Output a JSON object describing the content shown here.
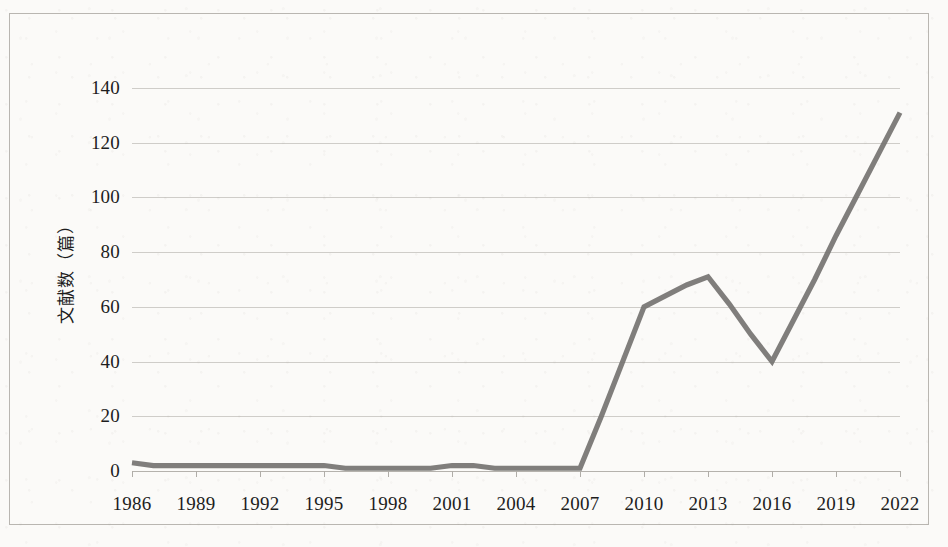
{
  "chart_data": {
    "type": "line",
    "title": "",
    "xlabel": "",
    "ylabel": "文献数（篇）",
    "ylim": [
      0,
      140
    ],
    "yticks": [
      0,
      20,
      40,
      60,
      80,
      100,
      120,
      140
    ],
    "xticklabels": [
      "1986",
      "1989",
      "1992",
      "1995",
      "1998",
      "2001",
      "2004",
      "2007",
      "2010",
      "2013",
      "2016",
      "2019",
      "2022"
    ],
    "xlim": [
      1986,
      2022
    ],
    "grid": true,
    "legend": false,
    "legend_position": "none",
    "line_color": "#767472",
    "x": [
      1986,
      1987,
      1988,
      1989,
      1990,
      1991,
      1992,
      1993,
      1994,
      1995,
      1996,
      1997,
      1998,
      1999,
      2000,
      2001,
      2002,
      2003,
      2004,
      2005,
      2006,
      2007,
      2008,
      2009,
      2010,
      2011,
      2012,
      2013,
      2014,
      2015,
      2016,
      2017,
      2018,
      2019,
      2020,
      2021,
      2022
    ],
    "values": [
      3,
      2,
      2,
      2,
      2,
      2,
      2,
      2,
      2,
      2,
      1,
      1,
      1,
      1,
      1,
      2,
      2,
      1,
      1,
      1,
      1,
      1,
      20,
      40,
      60,
      64,
      68,
      71,
      61,
      50,
      40,
      55,
      70,
      86,
      101,
      116,
      131
    ],
    "series": [
      {
        "name": "文献数",
        "values": [
          3,
          2,
          2,
          2,
          2,
          2,
          2,
          2,
          2,
          2,
          1,
          1,
          1,
          1,
          1,
          2,
          2,
          1,
          1,
          1,
          1,
          1,
          20,
          40,
          60,
          64,
          68,
          71,
          61,
          50,
          40,
          55,
          70,
          86,
          101,
          116,
          131
        ]
      }
    ],
    "annotations": []
  },
  "axes": {
    "y_title": "文献数（篇）"
  },
  "colors": {
    "line": "#767472",
    "grid": "#cfcdc9",
    "border": "#b9b6b1",
    "background": "#fbfaf8",
    "text": "#1d1d1d"
  }
}
